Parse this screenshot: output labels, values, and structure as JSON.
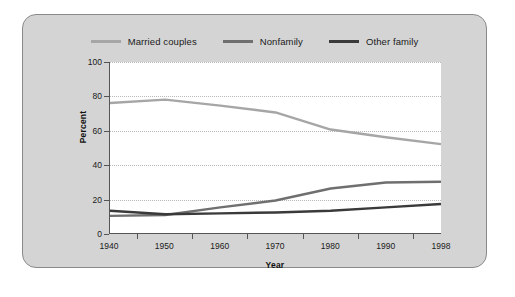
{
  "chart_data": {
    "type": "line",
    "title": "",
    "xlabel": "Year",
    "ylabel": "Percent",
    "x": [
      1940,
      1950,
      1960,
      1970,
      1980,
      1990,
      1998
    ],
    "xticklabels": [
      "1940",
      "1950",
      "1960",
      "1970",
      "1980",
      "1990",
      "1998"
    ],
    "yticklabels": [
      "0",
      "20",
      "40",
      "60",
      "80",
      "100"
    ],
    "ylim": [
      0,
      100
    ],
    "ytick_step": 20,
    "grid": "horizontal-dotted",
    "legend_position": "top-center",
    "series": [
      {
        "name": "Married couples",
        "color": "#a6a6a6",
        "values": [
          76,
          78,
          74.5,
          70.5,
          60.5,
          56,
          52
        ]
      },
      {
        "name": "Nonfamily",
        "color": "#6f6f6f",
        "values": [
          10,
          10.5,
          15,
          19,
          26,
          29.5,
          30
        ]
      },
      {
        "name": "Other family",
        "color": "#3a3a3a",
        "values": [
          13,
          11,
          11.5,
          12,
          13,
          15,
          17
        ]
      }
    ]
  },
  "colors": {
    "panel_background": "#d4d4d4",
    "panel_border": "#8a8a8a",
    "plot_background": "#ffffff",
    "axis": "#555555",
    "gridline": "#b9b9b9",
    "text": "#1a1a1a"
  }
}
